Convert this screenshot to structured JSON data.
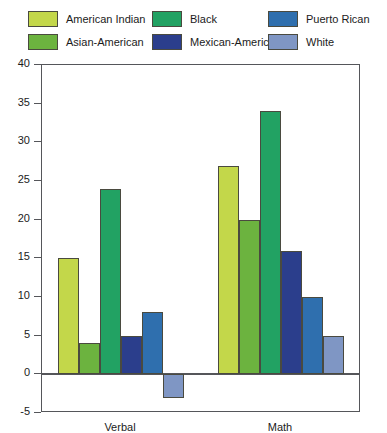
{
  "legend": {
    "items": [
      {
        "label": "American Indian",
        "color": "#c3d74a",
        "col": 0,
        "row": 0
      },
      {
        "label": "Asian-American",
        "color": "#6cb33f",
        "col": 0,
        "row": 1
      },
      {
        "label": "Black",
        "color": "#22a263",
        "col": 1,
        "row": 0
      },
      {
        "label": "Mexican-American",
        "color": "#2b3e8c",
        "col": 1,
        "row": 1
      },
      {
        "label": "Puerto Rican",
        "color": "#2f6fae",
        "col": 2,
        "row": 0
      },
      {
        "label": "White",
        "color": "#7f96c4",
        "col": 2,
        "row": 1
      }
    ]
  },
  "chart_data": {
    "type": "bar",
    "title": "",
    "xlabel": "",
    "ylabel": "",
    "categories": [
      "Verbal",
      "Math"
    ],
    "series": [
      {
        "name": "American Indian",
        "color": "#c3d74a",
        "values": [
          15,
          27
        ]
      },
      {
        "name": "Asian-American",
        "color": "#6cb33f",
        "values": [
          4,
          20
        ]
      },
      {
        "name": "Black",
        "color": "#22a263",
        "values": [
          24,
          34
        ]
      },
      {
        "name": "Mexican-American",
        "color": "#2b3e8c",
        "values": [
          5,
          16
        ]
      },
      {
        "name": "Puerto Rican",
        "color": "#2f6fae",
        "values": [
          8,
          10
        ]
      },
      {
        "name": "White",
        "color": "#7f96c4",
        "values": [
          -3,
          5
        ]
      }
    ],
    "ylim": [
      -5,
      40
    ],
    "yticks": [
      -5,
      0,
      5,
      10,
      15,
      20,
      25,
      30,
      35,
      40
    ],
    "ytick_labels": [
      "-5",
      "0",
      "5",
      "10",
      "15",
      "20",
      "25",
      "30",
      "35",
      "40"
    ],
    "grid": false,
    "legend_position": "top",
    "axis_color": "#55565a",
    "bar_border_color": "#4a4a3f",
    "plot_background": "#ffffff"
  }
}
